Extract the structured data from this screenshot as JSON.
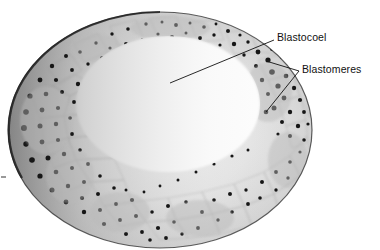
{
  "figure": {
    "kind": "micrograph",
    "background_color": "#ffffff",
    "width": 380,
    "height": 250
  },
  "annotations": [
    {
      "id": "blastocoel",
      "label": "Blastocoel",
      "text_x": 277,
      "text_y": 31,
      "leader": {
        "x1": 274,
        "y1": 40,
        "x2": 170,
        "y2": 83
      },
      "color": "#111111"
    },
    {
      "id": "blastomeres",
      "label": "Blastomeres",
      "text_x": 302,
      "text_y": 63,
      "leader_branches": [
        {
          "x1": 299,
          "y1": 71,
          "x2": 266,
          "y2": 61
        },
        {
          "x1": 299,
          "y1": 71,
          "x2": 266,
          "y2": 112
        }
      ],
      "color": "#111111"
    }
  ],
  "specimen": {
    "outline_color": "#2b2b2b",
    "cytoplasm_color": "#e2e2e2",
    "nucleus_color": "#1a1a1a",
    "cavity_color": "#ffffff",
    "center_x": 160,
    "center_y": 130,
    "outer_rx": 152,
    "outer_ry": 118,
    "cavity_cx": 168,
    "cavity_cy": 104,
    "cavity_rx": 92,
    "cavity_ry": 68
  },
  "edge_tick": {
    "x": 1,
    "y": 176,
    "width": 5,
    "height": 2,
    "color": "#999999"
  }
}
